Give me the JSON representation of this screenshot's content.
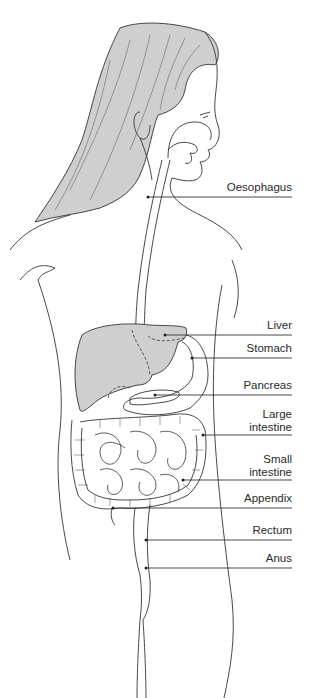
{
  "colors": {
    "hair_fill": "#cfcfcf",
    "liver_fill": "#cfcfcf",
    "line": "#333333",
    "background": "#ffffff"
  },
  "labels": [
    {
      "id": "oesophagus",
      "text": "Oesophagus"
    },
    {
      "id": "liver",
      "text": "Liver"
    },
    {
      "id": "stomach",
      "text": "Stomach"
    },
    {
      "id": "pancreas",
      "text": "Pancreas"
    },
    {
      "id": "large-intestine",
      "text": "Large\nintestine"
    },
    {
      "id": "small-intestine",
      "text": "Small\nintestine"
    },
    {
      "id": "appendix",
      "text": "Appendix"
    },
    {
      "id": "rectum",
      "text": "Rectum"
    },
    {
      "id": "anus",
      "text": "Anus"
    }
  ]
}
